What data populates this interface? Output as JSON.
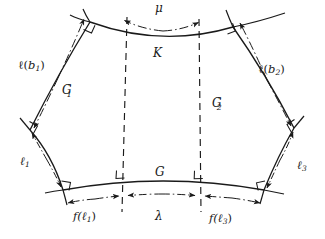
{
  "figure": {
    "type": "geometric-diagram",
    "background_color": "#ffffff",
    "stroke_color": "#1a1a1a",
    "labels": {
      "top_measure": "μ",
      "top_curve": "K",
      "left_upper_measure_base": "ℓ(",
      "left_upper_measure_sub": "b",
      "left_upper_measure_index": "1",
      "left_upper_measure_close": ")",
      "right_upper_measure_base": "ℓ(",
      "right_upper_measure_sub": "b",
      "right_upper_measure_index": "2",
      "right_upper_measure_close": ")",
      "left_region": "G",
      "left_region_sub": "1",
      "left_region_prime": "″",
      "right_region": "G",
      "right_region_sub": "2",
      "right_region_prime": "″",
      "left_lower_measure": "ℓ",
      "left_lower_measure_sub": "1",
      "right_lower_measure": "ℓ",
      "right_lower_measure_sub": "3",
      "bottom_curve": "G",
      "bottom_left_measure": "f(ℓ",
      "bottom_left_measure_sub": "1",
      "bottom_left_measure_close": ")",
      "bottom_center_measure": "λ",
      "bottom_right_measure": "f(ℓ",
      "bottom_right_measure_sub": "3",
      "bottom_right_measure_close": ")"
    },
    "elements": {
      "right_angle_marks": 8,
      "vertical_dashed_lines": 2,
      "dashdot_measure_lines": 6
    }
  }
}
